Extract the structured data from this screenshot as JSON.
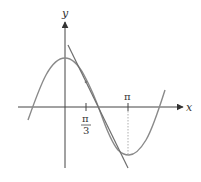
{
  "figure": {
    "axes": {
      "x_label": "x",
      "y_label": "y"
    },
    "ticks": {
      "pi_over_3": {
        "numerator": "π",
        "denominator": "3"
      },
      "pi": {
        "label": "π"
      }
    },
    "curves": [
      {
        "name": "cosine curve",
        "expression": "y = cos x",
        "color": "#8a8a8a"
      },
      {
        "name": "tangent line",
        "expression": "tangent at x = π/3",
        "color": "#6e6e6e"
      }
    ],
    "point": {
      "x": "π/3",
      "y": "1/2"
    },
    "colors": {
      "axis": "#444444",
      "curve": "#8a8a8a",
      "tangent": "#6e6e6e",
      "dotted_guide": "#9a9a9a"
    }
  }
}
